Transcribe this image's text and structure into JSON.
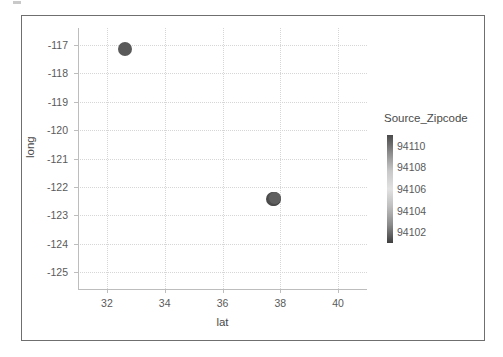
{
  "chart_data": {
    "type": "scatter",
    "title": "",
    "xlabel": "lat",
    "ylabel": "long",
    "xlim": [
      31,
      41
    ],
    "ylim": [
      -125.6,
      -116.4
    ],
    "xticks": [
      32,
      34,
      36,
      38,
      40
    ],
    "xtick_labels": [
      "32",
      "34",
      "36",
      "38",
      "40"
    ],
    "yticks": [
      -117,
      -118,
      -119,
      -120,
      -121,
      -122,
      -123,
      -124,
      -125
    ],
    "ytick_labels": [
      "-117",
      "-118",
      "-119",
      "-120",
      "-121",
      "-122",
      "-123",
      "-124",
      "-125"
    ],
    "grid": true,
    "grid_style": "dotted",
    "grid_color": "#d6d6d6",
    "legend_position": "right",
    "points": [
      {
        "lat": 32.62,
        "long": -117.13,
        "size": 7,
        "color": "#595959"
      },
      {
        "lat": 37.78,
        "long": -122.41,
        "size": 7,
        "color": "#3f3f3f"
      },
      {
        "lat": 37.76,
        "long": -122.43,
        "size": 7,
        "color": "#4a4a4a"
      },
      {
        "lat": 37.79,
        "long": -122.39,
        "size": 6,
        "color": "#555555"
      },
      {
        "lat": 37.77,
        "long": -122.42,
        "size": 6,
        "color": "#4f4f4f"
      },
      {
        "lat": 37.8,
        "long": -122.4,
        "size": 6,
        "color": "#606060"
      }
    ],
    "colorbar": {
      "label": "Source_Zipcode",
      "ticks": [
        94110,
        94108,
        94106,
        94104,
        94102
      ],
      "tick_labels": [
        "94110",
        "94108",
        "94106",
        "94104",
        "94102"
      ],
      "vmin": 94101,
      "vmax": 94111,
      "gradient_stops": [
        "#4a4a4a",
        "#8c8c8c",
        "#c8c8c8",
        "#e2e2e2",
        "#bdbdbd",
        "#8a8a8a",
        "#3f3f3f"
      ]
    }
  },
  "colors": {
    "frame": "#6f6f6f",
    "axis": "#bdbdbd",
    "text": "#4a4a4a",
    "tick_text": "#5a5a5a",
    "grid": "#d6d6d6",
    "background": "#ffffff"
  }
}
